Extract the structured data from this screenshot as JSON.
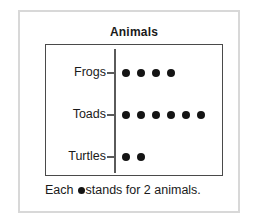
{
  "figure": {
    "title": "Animals",
    "key_prefix": "Each",
    "key_suffix": "stands for 2 animals.",
    "key_symbol": "dot",
    "border_color": "#4a4a4a",
    "frame_color": "#d8d8d8",
    "dot_color": "#141414",
    "text_color": "#1a1a1a"
  },
  "chart_data": {
    "type": "pictograph",
    "title": "Animals",
    "xlabel": "",
    "ylabel": "",
    "categories": [
      "Frogs",
      "Toads",
      "Turtles"
    ],
    "symbol_counts": [
      4,
      6,
      2
    ],
    "symbol_value": 2,
    "values": [
      8,
      12,
      4
    ],
    "key": "Each ● stands for 2 animals.",
    "legend": "none",
    "grid": false,
    "orientation": "horizontal",
    "rows": [
      {
        "label": "Frogs",
        "symbols": 4,
        "value": 8
      },
      {
        "label": "Toads",
        "symbols": 6,
        "value": 12
      },
      {
        "label": "Turtles",
        "symbols": 2,
        "value": 4
      }
    ]
  }
}
